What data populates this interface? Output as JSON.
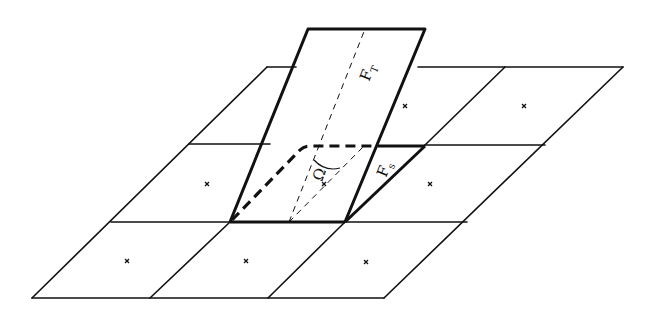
{
  "diagram": {
    "colors": {
      "line": "#111111",
      "background": "#ffffff"
    },
    "grid": {
      "rows": 3,
      "cols": 3,
      "corners": {
        "top_left": [
          267,
          67
        ],
        "top_right": [
          623,
          67
        ],
        "bottom_left": [
          32,
          298
        ],
        "bottom_right": [
          384,
          298
        ]
      },
      "cell_centers_marked": [
        [
          405,
          106
        ],
        [
          524,
          106
        ],
        [
          207,
          184
        ],
        [
          324,
          184
        ],
        [
          430,
          184
        ],
        [
          127,
          261
        ],
        [
          246,
          261
        ],
        [
          366,
          262
        ]
      ]
    },
    "tilted_plane": {
      "corners": {
        "top_left": [
          308,
          29
        ],
        "top_right": [
          425,
          29
        ],
        "bottom_left": [
          230,
          222
        ],
        "bottom_right": [
          345,
          222
        ]
      }
    },
    "labels": {
      "plane_force": {
        "main": "F",
        "sub": "T"
      },
      "triangle_force": {
        "main": "F",
        "sub": "s"
      },
      "angle": "Ω"
    }
  }
}
